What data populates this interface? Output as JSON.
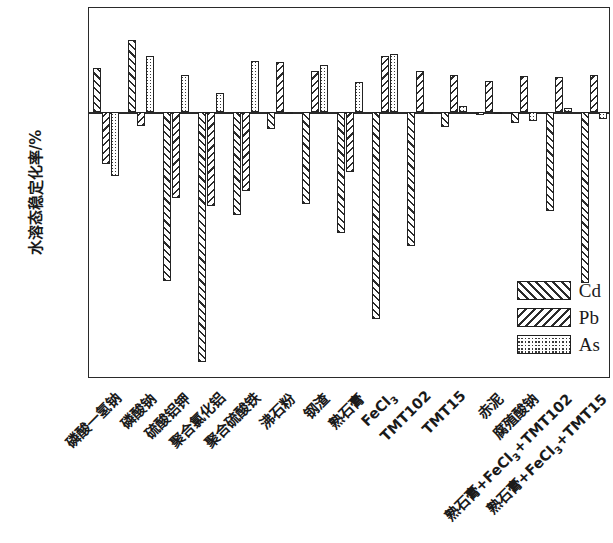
{
  "axes": {
    "ylabel": "水溶态稳定化率/%",
    "yticks": [
      100,
      50,
      0,
      -50,
      -100,
      -150,
      -200,
      -250,
      -300
    ],
    "ylim": [
      125,
      -320
    ],
    "xlabel": ""
  },
  "legend": {
    "position": "bottom-right",
    "entries": [
      {
        "key": "Cd",
        "label": "Cd",
        "pattern": "forward-diagonal-hatch"
      },
      {
        "key": "Pb",
        "label": "Pb",
        "pattern": "backward-diagonal-hatch"
      },
      {
        "key": "As",
        "label": "As",
        "pattern": "dotted-grid"
      }
    ]
  },
  "chart_data": {
    "type": "bar",
    "title": "",
    "xlabel": "",
    "ylabel": "水溶态稳定化率/%",
    "ylim": [
      -320,
      125
    ],
    "yticks": [
      100,
      50,
      0,
      -50,
      -100,
      -150,
      -200,
      -250,
      -300
    ],
    "grid": false,
    "legend_position": "bottom-right",
    "categories": [
      "磷酸一氢钠",
      "磷酸钠",
      "硫酸铝钾",
      "聚合氯化铝",
      "聚合硫酸铁",
      "沸石粉",
      "钢渣",
      "熟石膏",
      "FeCl3",
      "TMT102",
      "TMT15",
      "赤泥",
      "腐殖酸钠",
      "熟石膏+FeCl3+TMT102",
      "熟石膏+FeCl3+TMT15"
    ],
    "categories_html": [
      "磷酸一氢钠",
      "磷酸钠",
      "硫酸铝钾",
      "聚合氯化铝",
      "聚合硫酸铁",
      "沸石粉",
      "钢渣",
      "熟石膏",
      "FeCl<sub>3</sub>",
      "TMT102",
      "TMT15",
      "赤泥",
      "腐殖酸钠",
      "熟石膏+FeCl<sub>3</sub>+TMT102",
      "熟石膏+FeCl<sub>3</sub>+TMT15"
    ],
    "series": [
      {
        "name": "Cd",
        "values": [
          53,
          87,
          -203,
          -300,
          -123,
          -20,
          -110,
          -145,
          -248,
          -160,
          -18,
          -3,
          -13,
          -118,
          -205
        ]
      },
      {
        "name": "Pb",
        "values": [
          -62,
          -17,
          -103,
          -113,
          -95,
          60,
          50,
          -72,
          68,
          50,
          45,
          38,
          43,
          42,
          45
        ]
      },
      {
        "name": "As",
        "values": [
          -76,
          67,
          45,
          23,
          61,
          -1,
          57,
          36,
          70,
          -2,
          8,
          -2,
          -10,
          5,
          -8
        ]
      }
    ]
  }
}
